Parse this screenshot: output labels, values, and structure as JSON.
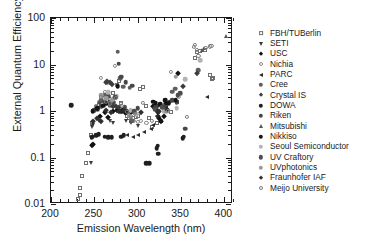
{
  "chart_data": {
    "type": "scatter",
    "title": "",
    "xlabel": "Emission Wavelength (nm)",
    "ylabel": "External Quantum Efficiency (%)",
    "xlim": [
      200,
      410
    ],
    "ylim": [
      0.01,
      100
    ],
    "yscale": "log",
    "xscale": "linear",
    "grid": false,
    "legend_position": "right-outside",
    "xticks": [
      200,
      250,
      300,
      350,
      400
    ],
    "xtick_labels": [
      "200",
      "250",
      "300",
      "350",
      "400"
    ],
    "yticks": [
      0.01,
      0.1,
      1,
      10,
      100
    ],
    "ytick_labels": [
      "0.01",
      "0.1",
      "1",
      "10",
      "100"
    ],
    "series": [
      {
        "name": "FBH/TUBerlin",
        "marker": "open-square",
        "color": "#6e6e6e",
        "points": [
          [
            231,
            0.013
          ],
          [
            233,
            0.016
          ],
          [
            234,
            0.022
          ],
          [
            236,
            0.04
          ],
          [
            240,
            0.078
          ],
          [
            243,
            0.125
          ],
          [
            246,
            0.3
          ],
          [
            247,
            0.55
          ],
          [
            249,
            1.0
          ],
          [
            252,
            1.2
          ],
          [
            255,
            1.35
          ],
          [
            262,
            1.5
          ],
          [
            265,
            2.0
          ],
          [
            268,
            1.6
          ],
          [
            272,
            2.4
          ],
          [
            276,
            3.6
          ],
          [
            278,
            4.5
          ],
          [
            281,
            1.45
          ],
          [
            285,
            1.0
          ],
          [
            288,
            0.8
          ],
          [
            290,
            0.72
          ],
          [
            292,
            0.62
          ],
          [
            295,
            0.7
          ],
          [
            298,
            0.75
          ],
          [
            300,
            0.8
          ],
          [
            303,
            2.9
          ],
          [
            306,
            3.3
          ],
          [
            310,
            1.3
          ],
          [
            313,
            0.7
          ],
          [
            317,
            0.45
          ],
          [
            322,
            0.55
          ],
          [
            327,
            0.62
          ],
          [
            338,
            0.95
          ],
          [
            366,
            13.5
          ],
          [
            368,
            18.5
          ],
          [
            372,
            20.0
          ],
          [
            378,
            21.0
          ],
          [
            384,
            6.0
          ],
          [
            386,
            4.8
          ],
          [
            387,
            5.2
          ]
        ]
      },
      {
        "name": "SETI",
        "marker": "down-triangle",
        "color": "#3a3a3a",
        "points": [
          [
            246,
            0.075
          ],
          [
            247,
            0.45
          ],
          [
            249,
            0.5
          ],
          [
            255,
            0.6
          ],
          [
            262,
            1.9
          ],
          [
            268,
            0.62
          ],
          [
            272,
            0.55
          ],
          [
            286,
            0.62
          ],
          [
            292,
            0.55
          ],
          [
            300,
            0.48
          ]
        ]
      },
      {
        "name": "USC",
        "marker": "diamond",
        "color": "#111111",
        "points": [
          [
            247,
            0.19
          ],
          [
            248,
            0.2
          ],
          [
            257,
            0.8
          ],
          [
            262,
            0.95
          ],
          [
            266,
            0.75
          ],
          [
            272,
            1.0
          ],
          [
            276,
            1.05
          ],
          [
            281,
            1.0
          ],
          [
            285,
            0.95
          ],
          [
            292,
            0.95
          ],
          [
            318,
            1.25
          ],
          [
            320,
            1.35
          ],
          [
            322,
            1.05
          ],
          [
            323,
            0.95
          ],
          [
            324,
            0.8
          ],
          [
            325,
            0.7
          ],
          [
            327,
            0.62
          ],
          [
            330,
            0.8
          ],
          [
            333,
            1.5
          ],
          [
            347,
            6.5
          ]
        ]
      },
      {
        "name": "Nichia",
        "marker": "open-circle",
        "color": "#8a8a8a",
        "points": [
          [
            252,
            1.25
          ],
          [
            255,
            1.55
          ],
          [
            258,
            5.2
          ],
          [
            262,
            2.6
          ],
          [
            264,
            2.2
          ],
          [
            266,
            4.0
          ],
          [
            268,
            1.8
          ],
          [
            272,
            1.6
          ],
          [
            274,
            9.5
          ],
          [
            276,
            3.5
          ],
          [
            281,
            1.4
          ],
          [
            285,
            1.2
          ],
          [
            288,
            1.0
          ],
          [
            290,
            0.95
          ],
          [
            292,
            0.72
          ],
          [
            296,
            0.62
          ],
          [
            300,
            0.58
          ],
          [
            304,
            0.62
          ],
          [
            310,
            0.55
          ],
          [
            338,
            6.8
          ],
          [
            348,
            2.0
          ]
        ]
      },
      {
        "name": "PARC",
        "marker": "left-triangle",
        "color": "#2b2b2b",
        "points": [
          [
            276,
            1.0
          ],
          [
            281,
            0.95
          ],
          [
            288,
            0.3
          ],
          [
            295,
            0.28
          ],
          [
            300,
            0.3
          ],
          [
            307,
            0.35
          ],
          [
            315,
            0.42
          ],
          [
            318,
            0.5
          ],
          [
            322,
            0.8
          ],
          [
            324,
            0.95
          ],
          [
            330,
            1.0
          ],
          [
            333,
            1.2
          ],
          [
            345,
            1.6
          ],
          [
            380,
            2.0
          ]
        ]
      },
      {
        "name": "Cree",
        "marker": "circle",
        "color": "#5e5e5e",
        "points": [
          [
            258,
            1.7
          ],
          [
            262,
            2.2
          ],
          [
            268,
            1.35
          ],
          [
            272,
            1.3
          ],
          [
            277,
            19.0
          ],
          [
            280,
            5.0
          ],
          [
            283,
            3.3
          ],
          [
            291,
            3.2
          ],
          [
            294,
            0.62
          ],
          [
            340,
            2.6
          ],
          [
            343,
            3.0
          ],
          [
            370,
            7.5
          ]
        ]
      },
      {
        "name": "Crystal IS",
        "marker": "diamond",
        "color": "#3d3d3d",
        "points": [
          [
            263,
            4.2
          ],
          [
            265,
            4.4
          ],
          [
            268,
            4.3
          ],
          [
            270,
            3.8
          ],
          [
            272,
            1.3
          ],
          [
            275,
            1.25
          ],
          [
            278,
            1.2
          ],
          [
            288,
            1.0
          ],
          [
            320,
            1.2
          ],
          [
            322,
            1.3
          ],
          [
            325,
            1.0
          ],
          [
            330,
            1.25
          ],
          [
            352,
            3.5
          ],
          [
            368,
            6.5
          ]
        ]
      },
      {
        "name": "DOWA",
        "marker": "circle",
        "color": "#1f1f1f",
        "points": [
          [
            223,
            1.35
          ],
          [
            247,
            0.27
          ],
          [
            248,
            0.28
          ],
          [
            252,
            0.3
          ],
          [
            255,
            0.32
          ],
          [
            262,
            0.28
          ],
          [
            266,
            0.27
          ],
          [
            270,
            0.27
          ],
          [
            281,
            0.28
          ],
          [
            284,
            0.3
          ],
          [
            310,
            0.075
          ],
          [
            313,
            0.075
          ],
          [
            322,
            0.16
          ],
          [
            323,
            0.18
          ],
          [
            324,
            0.12
          ],
          [
            352,
            0.26
          ],
          [
            353,
            0.28
          ]
        ]
      },
      {
        "name": "Riken",
        "marker": "circle",
        "color": "#474747",
        "points": [
          [
            250,
            1.05
          ],
          [
            254,
            1.1
          ],
          [
            258,
            1.25
          ],
          [
            266,
            2.1
          ],
          [
            272,
            1.5
          ],
          [
            278,
            10.5
          ],
          [
            281,
            5.5
          ],
          [
            286,
            4.2
          ],
          [
            294,
            3.5
          ],
          [
            300,
            1.15
          ],
          [
            337,
            1.6
          ],
          [
            340,
            1.7
          ],
          [
            345,
            1.55
          ],
          [
            355,
            0.42
          ]
        ]
      },
      {
        "name": "Mitsubishi",
        "marker": "up-triangle",
        "color": "#555555",
        "points": [
          [
            374,
            21.0
          ],
          [
            377,
            22.5
          ],
          [
            402,
            42.0
          ]
        ]
      },
      {
        "name": "Nikkiso",
        "marker": "circle",
        "color": "#141414",
        "points": [
          [
            248,
            1.0
          ],
          [
            253,
            1.15
          ],
          [
            260,
            1.3
          ],
          [
            264,
            1.45
          ],
          [
            268,
            1.6
          ],
          [
            277,
            3.4
          ],
          [
            283,
            1.05
          ],
          [
            287,
            0.95
          ],
          [
            318,
            1.6
          ],
          [
            321,
            1.5
          ],
          [
            326,
            1.4
          ],
          [
            332,
            1.7
          ],
          [
            336,
            1.45
          ],
          [
            344,
            1.7
          ]
        ]
      },
      {
        "name": "Seoul Semiconductor",
        "marker": "circle",
        "color": "#b3b3b3",
        "points": [
          [
            266,
            2.5
          ],
          [
            271,
            1.8
          ],
          [
            276,
            2.1
          ],
          [
            292,
            1.05
          ],
          [
            298,
            0.85
          ],
          [
            330,
            1.0
          ],
          [
            345,
            1.15
          ],
          [
            355,
            4.8
          ],
          [
            372,
            12.5
          ]
        ]
      },
      {
        "name": "UV Craftory",
        "marker": "circle",
        "color": "#4d4d4d",
        "points": [
          [
            256,
            1.5
          ],
          [
            261,
            1.6
          ],
          [
            268,
            1.55
          ],
          [
            274,
            2.0
          ],
          [
            285,
            1.2
          ],
          [
            296,
            1.0
          ],
          [
            320,
            1.1
          ],
          [
            328,
            1.2
          ],
          [
            346,
            2.2
          ],
          [
            349,
            2.4
          ]
        ]
      },
      {
        "name": "UVphotonics",
        "marker": "circle",
        "color": "#999999",
        "points": [
          [
            258,
            2.2
          ],
          [
            264,
            1.9
          ],
          [
            270,
            1.7
          ],
          [
            290,
            0.8
          ],
          [
            333,
            1.0
          ],
          [
            344,
            5.5
          ]
        ]
      },
      {
        "name": "Fraunhofer IAF",
        "marker": "diamond",
        "color": "#2f2f2f",
        "points": [
          [
            249,
            0.6
          ],
          [
            253,
            0.72
          ],
          [
            258,
            0.62
          ],
          [
            264,
            1.05
          ],
          [
            269,
            0.95
          ],
          [
            278,
            1.0
          ],
          [
            284,
            1.05
          ],
          [
            304,
            0.95
          ],
          [
            324,
            1.0
          ],
          [
            334,
            1.1
          ]
        ]
      },
      {
        "name": "Meijo University",
        "marker": "open-circle",
        "color": "#7d7d7d",
        "points": [
          [
            258,
            2.0
          ],
          [
            263,
            1.55
          ],
          [
            268,
            1.45
          ],
          [
            275,
            1.9
          ],
          [
            282,
            1.3
          ],
          [
            288,
            0.95
          ],
          [
            292,
            0.8
          ],
          [
            297,
            0.85
          ],
          [
            306,
            1.5
          ],
          [
            316,
            0.62
          ],
          [
            335,
            1.0
          ],
          [
            357,
            0.75
          ],
          [
            365,
            24.0
          ],
          [
            366,
            26.0
          ],
          [
            368,
            20.5
          ],
          [
            370,
            15.5
          ],
          [
            379,
            23.0
          ],
          [
            383,
            24.5
          ],
          [
            385,
            25.5
          ]
        ]
      }
    ]
  },
  "legend": {
    "entries": [
      {
        "label": "FBH/TUBerlin",
        "marker": "open-square",
        "color": "#6e6e6e"
      },
      {
        "label": "SETI",
        "marker": "down-triangle",
        "color": "#3a3a3a"
      },
      {
        "label": "USC",
        "marker": "diamond",
        "color": "#111111"
      },
      {
        "label": "Nichia",
        "marker": "open-circle",
        "color": "#8a8a8a"
      },
      {
        "label": "PARC",
        "marker": "left-triangle",
        "color": "#2b2b2b"
      },
      {
        "label": "Cree",
        "marker": "circle",
        "color": "#5e5e5e"
      },
      {
        "label": "Crystal IS",
        "marker": "diamond",
        "color": "#3d3d3d"
      },
      {
        "label": "DOWA",
        "marker": "circle",
        "color": "#1f1f1f"
      },
      {
        "label": "Riken",
        "marker": "circle",
        "color": "#474747"
      },
      {
        "label": "Mitsubishi",
        "marker": "up-triangle",
        "color": "#555555"
      },
      {
        "label": "Nikkiso",
        "marker": "circle",
        "color": "#141414"
      },
      {
        "label": "Seoul Semiconductor",
        "marker": "circle",
        "color": "#b3b3b3"
      },
      {
        "label": "UV Craftory",
        "marker": "circle",
        "color": "#4d4d4d"
      },
      {
        "label": "UVphotonics",
        "marker": "circle",
        "color": "#999999"
      },
      {
        "label": "Fraunhofer IAF",
        "marker": "diamond",
        "color": "#2f2f2f"
      },
      {
        "label": "Meijo University",
        "marker": "open-circle",
        "color": "#7d7d7d"
      }
    ]
  }
}
